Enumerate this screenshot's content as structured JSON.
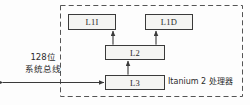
{
  "diagram": {
    "title_label": "Itanium 2 处理器",
    "boundary": {
      "name": "processor-boundary",
      "style": "dashed",
      "color": "#555555"
    },
    "nodes": [
      {
        "id": "l1i",
        "label": "L1I"
      },
      {
        "id": "l1d",
        "label": "L1D"
      },
      {
        "id": "l2",
        "label": "L2"
      },
      {
        "id": "l3",
        "label": "L3"
      }
    ],
    "bus": {
      "line1": "128位",
      "line2": "系统总线"
    },
    "connections": [
      {
        "from": "l2",
        "to": "l1i",
        "arrow": "double"
      },
      {
        "from": "l2",
        "to": "l1d",
        "arrow": "double"
      },
      {
        "from": "l3",
        "to": "l2",
        "arrow": "double"
      },
      {
        "from": "system-bus",
        "to": "l3",
        "arrow": "double"
      }
    ],
    "colors": {
      "box_border": "#3a3a3a",
      "box_fill": "#f4f4f2",
      "line": "#4a4a4a",
      "text": "#2b2b2b",
      "background": "#fdfdfd"
    }
  }
}
